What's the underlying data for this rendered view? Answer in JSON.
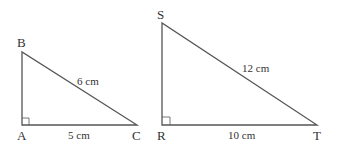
{
  "triangles": [
    {
      "vertices": {
        "top": "B",
        "right_angle": "A",
        "end": "C"
      },
      "hypotenuse": "6 cm",
      "base": "5 cm"
    },
    {
      "vertices": {
        "top": "S",
        "right_angle": "R",
        "end": "T"
      },
      "hypotenuse": "12 cm",
      "base": "10 cm"
    }
  ],
  "colors": {
    "stroke": "#555555",
    "text": "#333333"
  }
}
